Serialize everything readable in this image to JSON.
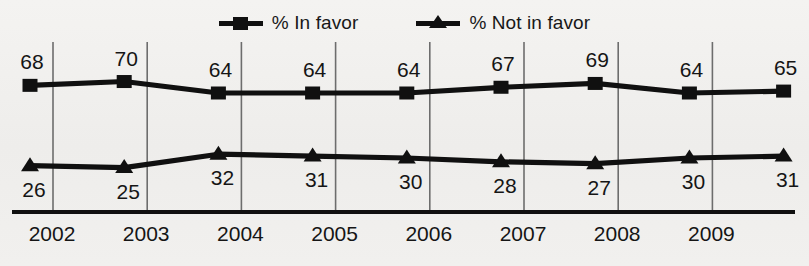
{
  "legend": {
    "items": [
      {
        "label": "% In favor",
        "marker": "square-marker-icon",
        "color": "#101010"
      },
      {
        "label": "% Not in favor",
        "marker": "triangle-marker-icon",
        "color": "#101010"
      }
    ]
  },
  "chart_data": {
    "type": "line",
    "title": "",
    "subtitle": "",
    "xlabel": "",
    "ylabel": "",
    "categories": [
      "2002",
      "2003",
      "2004",
      "2005",
      "2006",
      "2007",
      "2008",
      "2009",
      ""
    ],
    "tick_labels": [
      "2002",
      "2003",
      "2004",
      "2005",
      "2006",
      "2007",
      "2008",
      "2009"
    ],
    "series": [
      {
        "name": "% In favor",
        "marker": "square",
        "color": "#101010",
        "values": [
          68,
          70,
          64,
          64,
          64,
          67,
          69,
          64,
          65
        ],
        "label_position": "above"
      },
      {
        "name": "% Not in favor",
        "marker": "triangle",
        "color": "#101010",
        "values": [
          26,
          25,
          32,
          31,
          30,
          28,
          27,
          30,
          31
        ],
        "label_position": "below"
      }
    ],
    "ylim": [
      0,
      80
    ],
    "grid": "vertical",
    "legend_position": "top-center",
    "axis_line": "bottom"
  },
  "colors": {
    "background": "#f2f1ef",
    "ink": "#101010",
    "gridline": "#6d6d6d"
  }
}
